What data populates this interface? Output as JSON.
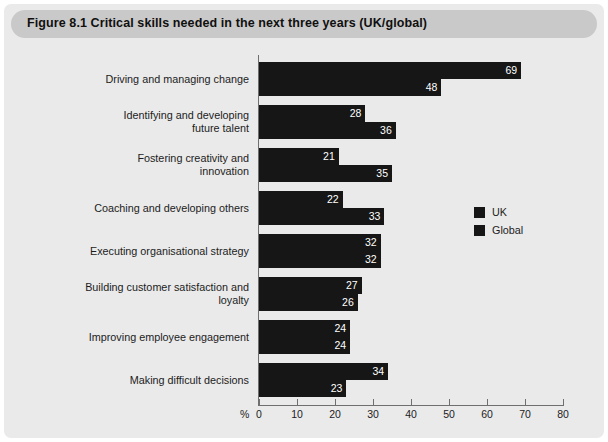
{
  "figure": {
    "title": "Figure 8.1  Critical skills needed in the next three years (UK/global)"
  },
  "legend": {
    "position": "right-middle",
    "items": [
      {
        "label": "UK",
        "color": "#161616",
        "swatch_icon": "square-swatch-icon"
      },
      {
        "label": "Global",
        "color": "#161616",
        "swatch_icon": "square-swatch-icon"
      }
    ]
  },
  "axis": {
    "unit_label": "%",
    "ticks": [
      "0",
      "10",
      "20",
      "30",
      "40",
      "50",
      "60",
      "70",
      "80"
    ]
  },
  "chart_data": {
    "type": "bar",
    "orientation": "horizontal",
    "title": "Figure 8.1  Critical skills needed in the next three years (UK/global)",
    "xlabel": "%",
    "ylabel": "",
    "xlim": [
      0,
      80
    ],
    "xticks": [
      0,
      10,
      20,
      30,
      40,
      50,
      60,
      70,
      80
    ],
    "grid": false,
    "legend_position": "right-middle",
    "categories": [
      "Driving and managing change",
      "Identifying and developing\nfuture talent",
      "Fostering creativity and\ninnovation",
      "Coaching and developing others",
      "Executing organisational strategy",
      "Building customer satisfaction and\nloyalty",
      "Improving employee engagement",
      "Making difficult decisions"
    ],
    "series": [
      {
        "name": "UK",
        "color": "#161616",
        "values": [
          69,
          28,
          21,
          22,
          32,
          27,
          24,
          34
        ]
      },
      {
        "name": "Global",
        "color": "#161616",
        "values": [
          48,
          36,
          35,
          33,
          32,
          26,
          24,
          23
        ]
      }
    ]
  }
}
